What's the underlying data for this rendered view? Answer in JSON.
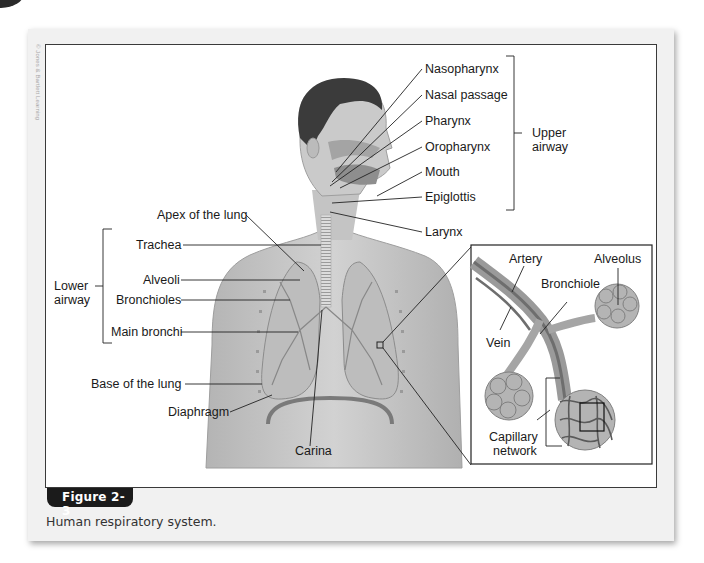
{
  "credit": "© Jones & Bartlett Learning",
  "figure": {
    "tab_label": "Figure 2-3",
    "caption": "Human respiratory system."
  },
  "labels": {
    "upper": [
      "Nasopharynx",
      "Nasal passage",
      "Pharynx",
      "Oropharynx",
      "Mouth",
      "Epiglottis"
    ],
    "larynx": "Larynx",
    "upper_group": [
      "Upper",
      "airway"
    ],
    "apex": "Apex of the lung",
    "lower": [
      "Trachea",
      "Alveoli",
      "Bronchioles",
      "Main bronchi"
    ],
    "lower_group": [
      "Lower",
      "airway"
    ],
    "base": "Base of the lung",
    "diaphragm": "Diaphragm",
    "carina": "Carina"
  },
  "inset": {
    "artery": "Artery",
    "alveolus": "Alveolus",
    "bronchiole": "Bronchiole",
    "vein": "Vein",
    "capillary": [
      "Capillary",
      "network"
    ]
  },
  "colors": {
    "skin": "#c9c9c9",
    "skin_dark": "#a9a9a9",
    "hair": "#3b3b3b",
    "lung": "#bdbdbd",
    "vessel": "#7a7a7a",
    "label": "#1a1a1a",
    "tab": "#1b1b1b"
  }
}
